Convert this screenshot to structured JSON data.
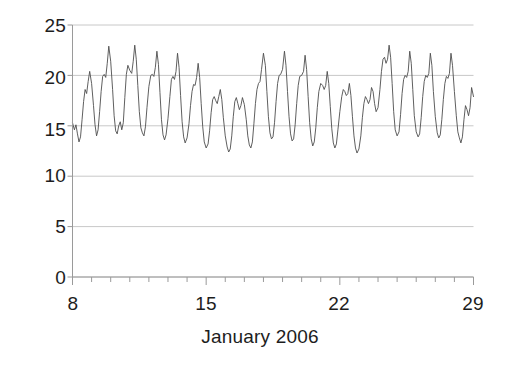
{
  "chart_data": {
    "type": "line",
    "title": "",
    "subtitle": "",
    "xlabel": "January 2006",
    "ylabel": "",
    "xlim": [
      8,
      29
    ],
    "ylim": [
      0,
      25
    ],
    "grid": true,
    "legend": null,
    "xticks": [
      8,
      15,
      22,
      29
    ],
    "xtick_labels": [
      "8",
      "15",
      "22",
      "29"
    ],
    "xminor_ticks": [
      9,
      10,
      11,
      12,
      13,
      14,
      16,
      17,
      18,
      19,
      20,
      21,
      23,
      24,
      25,
      26,
      27,
      28
    ],
    "yticks": [
      0,
      5,
      10,
      15,
      20,
      25
    ],
    "ytick_labels": [
      "0",
      "5",
      "10",
      "15",
      "20",
      "25"
    ],
    "line_color": "#4d4d4d",
    "line_width": 0.9,
    "grid_color": "#c8c8c8",
    "axis_color": "#9a9a9a",
    "background": "#ffffff",
    "series": [
      {
        "name": "value",
        "x": [
          8.0,
          8.1,
          8.18,
          8.26,
          8.34,
          8.42,
          8.5,
          8.58,
          8.66,
          8.74,
          8.82,
          8.9,
          9.0,
          9.1,
          9.18,
          9.26,
          9.34,
          9.42,
          9.5,
          9.58,
          9.66,
          9.74,
          9.82,
          9.9,
          10.0,
          10.1,
          10.18,
          10.26,
          10.34,
          10.42,
          10.5,
          10.58,
          10.66,
          10.74,
          10.82,
          10.9,
          11.0,
          11.1,
          11.18,
          11.26,
          11.34,
          11.42,
          11.5,
          11.58,
          11.66,
          11.74,
          11.82,
          11.9,
          12.0,
          12.1,
          12.18,
          12.26,
          12.34,
          12.42,
          12.5,
          12.58,
          12.66,
          12.74,
          12.82,
          12.9,
          13.0,
          13.1,
          13.18,
          13.26,
          13.34,
          13.42,
          13.5,
          13.58,
          13.66,
          13.74,
          13.82,
          13.9,
          14.0,
          14.1,
          14.18,
          14.26,
          14.34,
          14.42,
          14.5,
          14.58,
          14.66,
          14.74,
          14.82,
          14.9,
          15.0,
          15.1,
          15.18,
          15.26,
          15.34,
          15.42,
          15.5,
          15.58,
          15.66,
          15.74,
          15.82,
          15.9,
          16.0,
          16.1,
          16.18,
          16.26,
          16.34,
          16.42,
          16.5,
          16.58,
          16.66,
          16.74,
          16.82,
          16.9,
          17.0,
          17.1,
          17.18,
          17.26,
          17.34,
          17.42,
          17.5,
          17.58,
          17.66,
          17.74,
          17.82,
          17.9,
          18.0,
          18.1,
          18.18,
          18.26,
          18.34,
          18.42,
          18.5,
          18.58,
          18.66,
          18.74,
          18.82,
          18.9,
          19.0,
          19.1,
          19.18,
          19.26,
          19.34,
          19.42,
          19.5,
          19.58,
          19.66,
          19.74,
          19.82,
          19.9,
          20.0,
          20.1,
          20.18,
          20.26,
          20.34,
          20.42,
          20.5,
          20.58,
          20.66,
          20.74,
          20.82,
          20.9,
          21.0,
          21.1,
          21.18,
          21.26,
          21.34,
          21.42,
          21.5,
          21.58,
          21.66,
          21.74,
          21.82,
          21.9,
          22.0,
          22.1,
          22.18,
          22.26,
          22.34,
          22.42,
          22.5,
          22.58,
          22.66,
          22.74,
          22.82,
          22.9,
          23.0,
          23.1,
          23.18,
          23.26,
          23.34,
          23.42,
          23.5,
          23.58,
          23.66,
          23.74,
          23.82,
          23.9,
          24.0,
          24.1,
          24.18,
          24.26,
          24.34,
          24.42,
          24.5,
          24.58,
          24.66,
          24.74,
          24.82,
          24.9,
          25.0,
          25.1,
          25.18,
          25.26,
          25.34,
          25.42,
          25.5,
          25.58,
          25.66,
          25.74,
          25.82,
          25.9,
          26.0,
          26.1,
          26.18,
          26.26,
          26.34,
          26.42,
          26.5,
          26.58,
          26.66,
          26.74,
          26.82,
          26.9,
          27.0,
          27.1,
          27.18,
          27.26,
          27.34,
          27.42,
          27.5,
          27.58,
          27.66,
          27.74,
          27.82,
          27.9,
          28.0,
          28.1,
          28.18,
          28.26,
          28.34,
          28.42,
          28.5,
          28.58,
          28.66,
          28.74,
          28.82,
          28.9,
          29.0
        ],
        "values": [
          15.3,
          14.6,
          15.1,
          14.2,
          13.4,
          13.9,
          15.6,
          17.4,
          18.6,
          18.2,
          19.4,
          20.4,
          19.2,
          17.0,
          15.1,
          14.0,
          14.6,
          16.4,
          18.4,
          19.9,
          20.1,
          19.8,
          21.2,
          22.9,
          21.4,
          18.6,
          16.0,
          14.5,
          14.2,
          15.0,
          15.4,
          14.6,
          15.3,
          17.8,
          20.1,
          21.0,
          20.5,
          20.2,
          21.4,
          23.0,
          21.6,
          19.0,
          16.4,
          14.8,
          14.3,
          14.0,
          14.9,
          16.8,
          18.9,
          20.0,
          20.1,
          19.9,
          20.8,
          22.4,
          21.1,
          18.3,
          15.6,
          14.1,
          13.6,
          14.1,
          15.7,
          17.9,
          19.6,
          19.9,
          19.6,
          20.4,
          22.2,
          20.8,
          18.0,
          15.4,
          13.9,
          13.3,
          13.8,
          15.2,
          17.0,
          18.4,
          19.1,
          19.0,
          19.8,
          21.2,
          19.8,
          17.2,
          14.9,
          13.4,
          12.8,
          13.2,
          14.5,
          16.3,
          17.6,
          17.9,
          17.5,
          17.2,
          17.9,
          18.6,
          17.6,
          15.8,
          14.0,
          12.9,
          12.4,
          12.7,
          14.0,
          15.9,
          17.4,
          17.8,
          17.2,
          16.6,
          17.0,
          17.8,
          17.1,
          15.6,
          14.0,
          13.1,
          12.8,
          13.4,
          15.2,
          17.2,
          18.6,
          19.2,
          19.4,
          20.6,
          22.2,
          21.0,
          18.4,
          15.9,
          14.3,
          13.7,
          13.9,
          15.3,
          17.4,
          19.2,
          20.0,
          20.1,
          20.6,
          22.4,
          21.0,
          18.4,
          15.9,
          14.2,
          13.5,
          13.7,
          15.1,
          17.2,
          19.0,
          19.9,
          20.0,
          20.4,
          22.0,
          20.6,
          17.9,
          15.3,
          13.7,
          13.0,
          13.4,
          14.8,
          16.8,
          18.4,
          19.2,
          19.0,
          18.6,
          19.0,
          20.4,
          19.2,
          16.9,
          14.7,
          13.3,
          12.8,
          13.2,
          14.6,
          16.4,
          17.9,
          18.6,
          18.4,
          18.0,
          18.2,
          19.2,
          18.0,
          15.9,
          14.0,
          12.8,
          12.3,
          12.7,
          14.0,
          15.8,
          17.2,
          17.9,
          17.6,
          17.2,
          17.6,
          18.8,
          18.4,
          17.2,
          16.4,
          16.8,
          18.6,
          20.4,
          21.6,
          21.8,
          21.2,
          21.6,
          23.0,
          21.8,
          19.2,
          16.4,
          14.6,
          14.0,
          14.4,
          16.1,
          18.2,
          19.6,
          20.0,
          19.8,
          20.4,
          22.4,
          21.2,
          18.6,
          16.0,
          14.4,
          13.9,
          14.2,
          15.8,
          17.9,
          19.4,
          20.0,
          19.8,
          20.2,
          22.2,
          21.0,
          18.4,
          15.9,
          14.3,
          13.8,
          14.1,
          15.6,
          17.6,
          19.2,
          19.9,
          19.7,
          20.2,
          22.2,
          21.0,
          18.4,
          16.0,
          14.4,
          13.8,
          13.3,
          13.9,
          15.6,
          17.0,
          16.6,
          16.0,
          16.8,
          18.8,
          17.9
        ]
      }
    ]
  },
  "axes": {
    "ytick_labels": [
      "25",
      "20",
      "15",
      "10",
      "5",
      "0"
    ],
    "xtick_labels": [
      "8",
      "15",
      "22",
      "29"
    ],
    "xlabel": "January 2006"
  }
}
